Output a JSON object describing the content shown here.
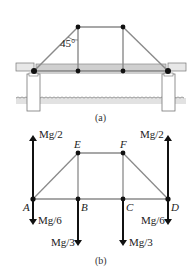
{
  "figure_a": {
    "caption": "(a)",
    "angle_label": "45°",
    "elements": [
      "bridge-deck",
      "truss",
      "left-pier",
      "right-pier",
      "water-surface"
    ]
  },
  "figure_b": {
    "caption": "(b)",
    "nodes": {
      "A": "A",
      "B": "B",
      "C": "C",
      "D": "D",
      "E": "E",
      "F": "F"
    },
    "forces": {
      "A_up": "Mg/2",
      "D_up": "Mg/2",
      "A_down": "Mg/6",
      "D_down": "Mg/6",
      "B_down": "Mg/3",
      "C_down": "Mg/3"
    }
  },
  "colors": {
    "truss_member": "#8a8a8a",
    "force_arrow": "#111111",
    "node": "#111111",
    "deck_fill": "#cfcfcf",
    "water_fill": "#dedede"
  }
}
